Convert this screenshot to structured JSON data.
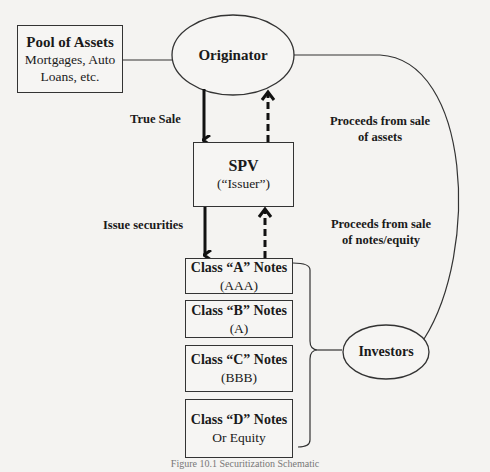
{
  "pool": {
    "title": "Pool of Assets",
    "line1": "Mortgages, Auto",
    "line2": "Loans, etc."
  },
  "originator": {
    "label": "Originator"
  },
  "spv": {
    "title": "SPV",
    "sub": "(“Issuer”)"
  },
  "labels": {
    "true_sale": "True Sale",
    "proceeds_assets_1": "Proceeds from sale",
    "proceeds_assets_2": "of assets",
    "issue_securities": "Issue securities",
    "proceeds_notes_1": "Proceeds from sale",
    "proceeds_notes_2": "of notes/equity"
  },
  "classes": [
    {
      "title": "Class “A” Notes",
      "sub": "(AAA)"
    },
    {
      "title": "Class “B” Notes",
      "sub": "(A)"
    },
    {
      "title": "Class “C” Notes",
      "sub": "(BBB)"
    },
    {
      "title": "Class “D” Notes",
      "sub": "Or Equity"
    }
  ],
  "investors": {
    "label": "Investors"
  },
  "caption": "Figure 10.1 Securitization Schematic"
}
